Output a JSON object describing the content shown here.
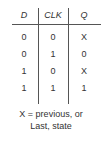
{
  "truth_table": {
    "headers": [
      "D",
      "CLK",
      "Q"
    ],
    "rows": [
      [
        "0",
        "0",
        "X"
      ],
      [
        "0",
        "1",
        "0"
      ],
      [
        "1",
        "0",
        "X"
      ],
      [
        "1",
        "1",
        "1"
      ]
    ]
  },
  "caption": {
    "line1": "X = previous, or",
    "line2": "Last, state"
  }
}
